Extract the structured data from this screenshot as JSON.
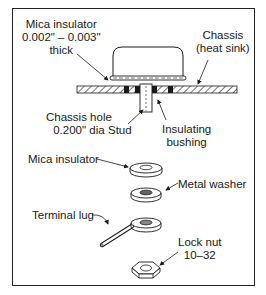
{
  "diagram": {
    "labels": {
      "mica_top_line1": "Mica insulator",
      "mica_top_line2": "0.002\" – 0.003\"",
      "mica_top_line3": "thick",
      "chassis_line1": "Chassis",
      "chassis_line2": "(heat sink)",
      "hole_line1": "Chassis hole",
      "hole_line2": "0.200\" dia",
      "stud": "Stud",
      "bushing_line1": "Insulating",
      "bushing_line2": "bushing",
      "mica_lower": "Mica insulator",
      "metal_washer": "Metal washer",
      "terminal_lug": "Terminal lug",
      "lock_nut_line1": "Lock nut",
      "lock_nut_line2": "10–32"
    },
    "parts": [
      "transistor case",
      "mica insulator",
      "chassis (heat sink)",
      "stud",
      "insulating bushing",
      "mica insulator",
      "metal washer",
      "terminal lug",
      "lock nut"
    ],
    "colors": {
      "line": "#1a1a1a",
      "background": "#ffffff"
    }
  }
}
